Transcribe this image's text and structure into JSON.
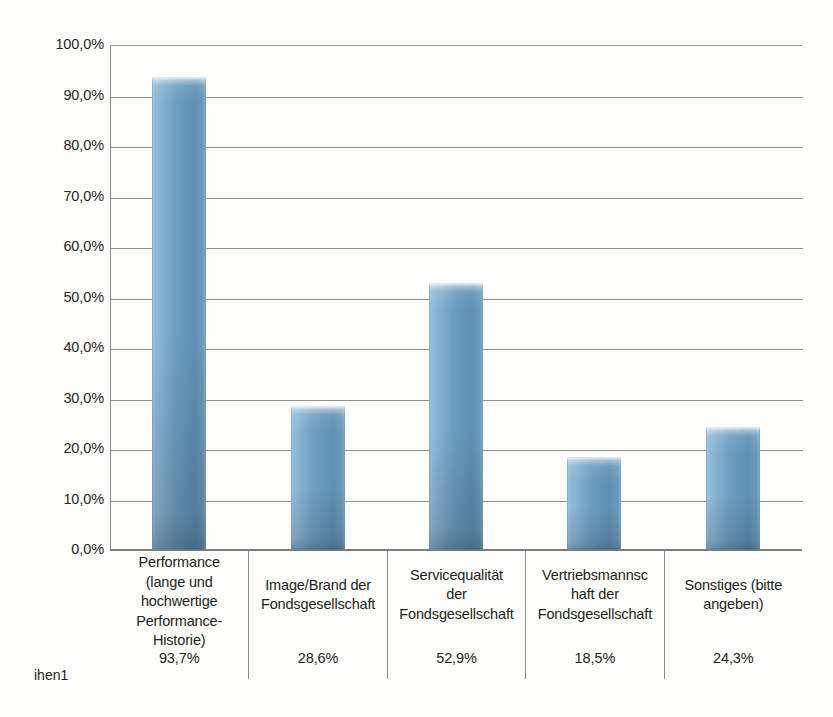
{
  "chart_data": {
    "type": "bar",
    "title": "",
    "xlabel": "",
    "ylabel": "",
    "ylim": [
      0,
      100
    ],
    "ytick_step": 10,
    "grid": true,
    "legend": "none",
    "value_suffix": "%",
    "decimal_separator": ",",
    "series_name": "ihen1",
    "categories": [
      "Performance (lange und hochwertige Performance-Historie)",
      "Image/Brand der Fondsgesellschaft",
      "Servicequalität der Fondsgesellschaft",
      "Vertriebsmannschaft der Fondsgesellschaft",
      "Sonstiges (bitte angeben)"
    ],
    "values": [
      93.7,
      28.6,
      52.9,
      18.5,
      24.3
    ],
    "value_labels": [
      "93,7%",
      "28,6%",
      "52,9%",
      "18,5%",
      "24,3%"
    ],
    "ytick_labels": [
      "100,0%",
      "90,0%",
      "80,0%",
      "70,0%",
      "60,0%",
      "50,0%",
      "40,0%",
      "30,0%",
      "20,0%",
      "10,0%",
      "0,0%"
    ],
    "bar_color": "#6f9fc0",
    "bar_highlight_color": "#9cc3de",
    "bar_shadow_color": "#5e8fb2",
    "gridline_color": "#8f8f8f",
    "axis_color": "#7d7d7d"
  },
  "category_lines": [
    [
      "Performance",
      "(lange und",
      "hochwertige",
      "Performance-",
      "Historie)"
    ],
    [
      "Image/Brand der",
      "Fondsgesellschaft"
    ],
    [
      "Servicequalität",
      "der",
      "Fondsgesellschaft"
    ],
    [
      "Vertriebsmannsc",
      "haft der",
      "Fondsgesellschaft"
    ],
    [
      "Sonstiges (bitte",
      "angeben)"
    ]
  ]
}
